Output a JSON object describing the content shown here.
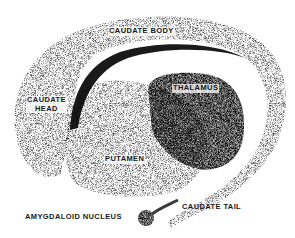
{
  "diagram": {
    "type": "anatomical-illustration",
    "style": "stipple",
    "colors": {
      "ink": "#1a1a1a",
      "background": "#ffffff"
    },
    "labels": {
      "caudate_body": "CAUDATE BODY",
      "caudate_head_line1": "CAUDATE",
      "caudate_head_line2": "HEAD",
      "thalamus": "THALAMUS",
      "putamen": "PUTAMEN",
      "caudate_tail": "CAUDATE TAIL",
      "amygdaloid_nucleus": "AMYGDALOID NUCLEUS"
    }
  }
}
